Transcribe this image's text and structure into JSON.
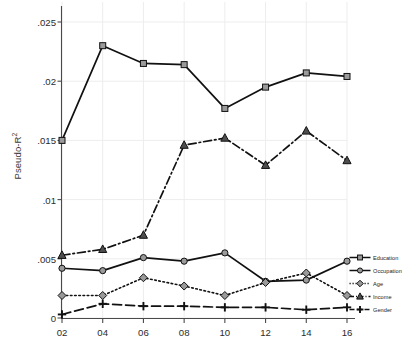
{
  "chart_data": {
    "type": "line",
    "title": "",
    "xlabel": "",
    "ylabel": "Pseudo-R",
    "ylabel_sup": "2",
    "x": [
      2002,
      2004,
      2006,
      2008,
      2010,
      2012,
      2014,
      2016
    ],
    "categories": [
      "02",
      "04",
      "06",
      "08",
      "10",
      "12",
      "14",
      "16"
    ],
    "xlim": [
      2002,
      2016
    ],
    "ylim": [
      0,
      0.025
    ],
    "yticks": [
      0,
      0.005,
      0.01,
      0.015,
      0.02,
      0.025
    ],
    "ytick_labels": [
      "0",
      ".005",
      ".01",
      ".015",
      ".02",
      ".025"
    ],
    "grid": "faint-vertical",
    "legend_position": "right-bottom",
    "series": [
      {
        "name": "Education",
        "marker": "square",
        "line": "solid",
        "values": [
          0.015,
          0.023,
          0.0215,
          0.0214,
          0.0177,
          0.0195,
          0.0207,
          0.0204
        ]
      },
      {
        "name": "Occupation",
        "marker": "circle",
        "line": "solid",
        "values": [
          0.0042,
          0.004,
          0.0051,
          0.0048,
          0.0055,
          0.0031,
          0.0032,
          0.0048
        ]
      },
      {
        "name": "Age",
        "marker": "diamond",
        "line": "dotted",
        "values": [
          0.0019,
          0.0019,
          0.0034,
          0.0027,
          0.0019,
          0.003,
          0.0038,
          0.0019
        ]
      },
      {
        "name": "Income",
        "marker": "triangle",
        "line": "dash-dot",
        "values": [
          0.0053,
          0.0058,
          0.007,
          0.0146,
          0.0152,
          0.0129,
          0.0158,
          0.0133
        ]
      },
      {
        "name": "Gender",
        "marker": "plus",
        "line": "dashed",
        "values": [
          0.0003,
          0.0012,
          0.001,
          0.001,
          0.0009,
          0.0009,
          0.0007,
          0.0009
        ]
      }
    ]
  },
  "colors": {
    "axis": "#4a4a4a",
    "line": "#111111",
    "marker_fill": "#9a9a9a",
    "grid": "#ededed",
    "text": "#2b2b2b"
  }
}
